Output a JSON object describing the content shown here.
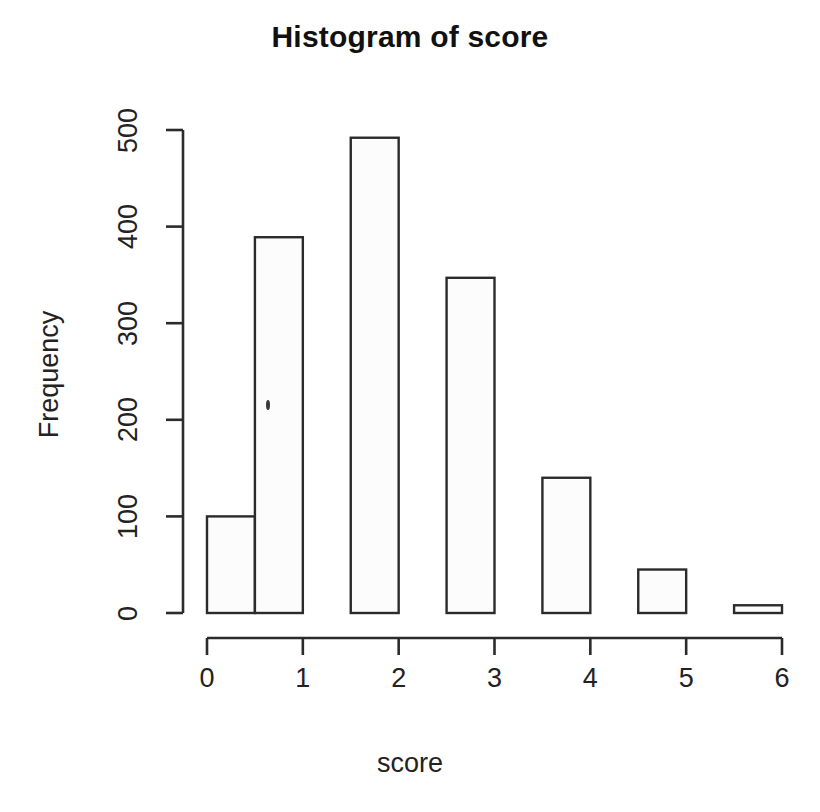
{
  "chart_data": {
    "type": "bar",
    "title": "Histogram of score",
    "xlabel": "score",
    "ylabel": "Frequency",
    "grid": false,
    "legend": null,
    "xlim": [
      0,
      6
    ],
    "ylim": [
      0,
      500
    ],
    "xticks": [
      "0",
      "1",
      "2",
      "3",
      "4",
      "5",
      "6"
    ],
    "xtick_values": [
      0,
      1,
      2,
      3,
      4,
      5,
      6
    ],
    "yticks": [
      "0",
      "100",
      "200",
      "300",
      "400",
      "500"
    ],
    "ytick_values": [
      0,
      100,
      200,
      300,
      400,
      500
    ],
    "bin_width": 0.5,
    "bins": [
      {
        "label": "0.0-0.5",
        "x0": 0.0,
        "x1": 0.5,
        "value": 100
      },
      {
        "label": "0.5-1.0",
        "x0": 0.5,
        "x1": 1.0,
        "value": 389
      },
      {
        "label": "1.5-2.0",
        "x0": 1.5,
        "x1": 2.0,
        "value": 492
      },
      {
        "label": "2.5-3.0",
        "x0": 2.5,
        "x1": 3.0,
        "value": 347
      },
      {
        "label": "3.5-4.0",
        "x0": 3.5,
        "x1": 4.0,
        "value": 140
      },
      {
        "label": "4.5-5.0",
        "x0": 4.5,
        "x1": 5.0,
        "value": 45
      },
      {
        "label": "5.5-6.0",
        "x0": 5.5,
        "x1": 6.0,
        "value": 8
      }
    ],
    "categories": [
      "0.0-0.5",
      "0.5-1.0",
      "1.5-2.0",
      "2.5-3.0",
      "3.5-4.0",
      "4.5-5.0",
      "5.5-6.0"
    ],
    "values": [
      100,
      389,
      492,
      347,
      140,
      45,
      8
    ],
    "colors": {
      "bar_fill": "#fcfcfc",
      "bar_stroke": "#2b2b2b",
      "axis": "#2b2b2b",
      "text": "#1a1a1a",
      "background": "#ffffff"
    }
  },
  "artifacts": {
    "speck": {
      "x": 266,
      "y": 400,
      "w": 4,
      "h": 10
    }
  }
}
